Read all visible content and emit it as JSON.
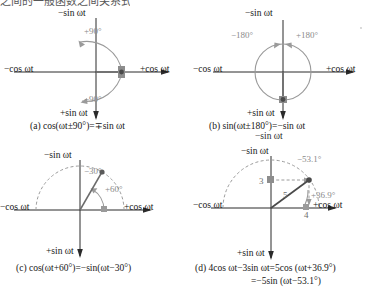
{
  "document": {
    "top_clipped_text": "之间的一般函数之间关系式",
    "axis_labels": {
      "neg_sin": "−sin ωt",
      "pos_sin": "+sin ωt",
      "neg_cos": "−cos ωt",
      "pos_cos": "+cos ωt"
    },
    "colors": {
      "ink": "#161616",
      "gray_annotation": "#8a8a8a",
      "phasor_gray": "#7a7a7a",
      "marker": "#6b6b6b"
    }
  },
  "panels": [
    {
      "id": "a",
      "caption": "(a) cos(ωt±90°)=∓sin ωt",
      "caption2": "",
      "angles": [
        "+90°",
        "−90°"
      ],
      "values": [],
      "marker_note": "phasor marker on +cos axis"
    },
    {
      "id": "b",
      "caption": "(b) sin(ωt±180°)=−sin ωt",
      "caption2": "−sin ωt",
      "angles": [
        "−180°",
        "+180°"
      ],
      "values": [],
      "marker_note": "phasor marker on +sin axis"
    },
    {
      "id": "c",
      "caption": "(c) cos(ωt+60°)=−sin(ωt−30°)",
      "caption2": "",
      "angles": [
        "−30°",
        "+60°"
      ],
      "values": [],
      "marker_note": "phasor at 120° from +cos axis"
    },
    {
      "id": "d",
      "caption": "(d) 4cos ωt−3sin ωt=5cos (ωt+36.9°)",
      "caption2": "=−5sin (ωt−53.1°)",
      "angles": [
        "−53.1°",
        "+36.9°"
      ],
      "values": [
        "3",
        "5",
        "4"
      ],
      "marker_note": "resultant phasor of magnitude 5"
    }
  ]
}
